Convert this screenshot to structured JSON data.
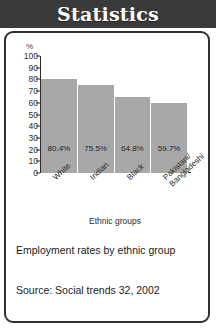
{
  "header": {
    "title": "Statistics"
  },
  "chart_data": {
    "type": "bar",
    "title": "",
    "xlabel": "Ethnic groups",
    "ylabel": "%",
    "ylim": [
      0,
      100
    ],
    "yticks": [
      "100",
      "90",
      "80",
      "70",
      "60",
      "50",
      "40",
      "30",
      "20",
      "10",
      "0"
    ],
    "grid": false,
    "legend": false,
    "categories": [
      "White",
      "Indian",
      "Black",
      "Pakistani/\nBangladeshi"
    ],
    "category_lines": [
      [
        "White"
      ],
      [
        "Indian"
      ],
      [
        "Black"
      ],
      [
        "Pakistani/",
        "Bangladeshi"
      ]
    ],
    "values": [
      80.4,
      75.5,
      64.8,
      59.7
    ],
    "value_labels": [
      "80.4%",
      "75.5%",
      "64.8%",
      "59.7%"
    ],
    "bar_color": "#a8a8a8",
    "axis_color": "#2b2b2b"
  },
  "caption": {
    "text": "Employment rates by ethnic group",
    "source": "Source: Social trends 32, 2002"
  }
}
